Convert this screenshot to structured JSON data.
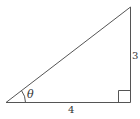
{
  "diagram": {
    "type": "right-triangle",
    "labels": {
      "angle": "θ",
      "base": "4",
      "height": "3"
    },
    "colors": {
      "stroke": "#555555",
      "text": "#333333",
      "background": "#ffffff"
    }
  }
}
